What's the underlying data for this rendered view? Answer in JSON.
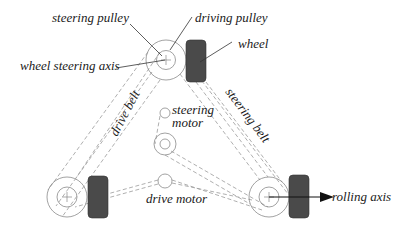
{
  "diagram": {
    "labels": {
      "steering_pulley": "steering pulley",
      "driving_pulley": "driving pulley",
      "wheel": "wheel",
      "wheel_steering_axis": "wheel steering axis",
      "drive_belt": "drive belt",
      "steering_belt": "steering belt",
      "steering_motor_line1": "steering",
      "steering_motor_line2": "motor",
      "drive_motor": "drive motor",
      "rolling_axis": "rolling axis"
    },
    "components": [
      {
        "name": "top-wheel-module",
        "center": [
          166,
          60
        ]
      },
      {
        "name": "bottom-left-wheel-module",
        "center": [
          67,
          197
        ]
      },
      {
        "name": "bottom-right-wheel-module",
        "center": [
          269,
          197
        ]
      },
      {
        "name": "steering-motor",
        "center": [
          165,
          113
        ]
      },
      {
        "name": "intermediate-pulley",
        "center": [
          165,
          144
        ]
      },
      {
        "name": "drive-motor",
        "center": [
          165,
          180
        ]
      }
    ],
    "colors": {
      "wheel_fill": "#4a4a4a",
      "line": "#8a8a8a",
      "text": "#1a1a1a"
    }
  }
}
